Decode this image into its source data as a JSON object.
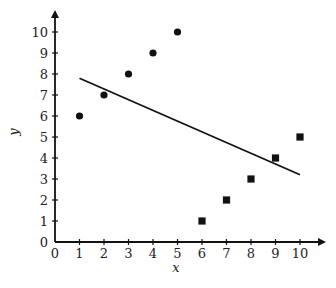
{
  "chart_data": {
    "type": "scatter",
    "title": "",
    "xlabel": "x",
    "ylabel": "y",
    "xlim": [
      0,
      10
    ],
    "ylim": [
      0,
      10
    ],
    "x_ticks": [
      "0",
      "1",
      "2",
      "3",
      "4",
      "5",
      "6",
      "7",
      "8",
      "9",
      "10"
    ],
    "y_ticks": [
      "0",
      "1",
      "2",
      "3",
      "4",
      "5",
      "6",
      "7",
      "8",
      "9",
      "10"
    ],
    "grid": false,
    "legend": null,
    "series": [
      {
        "name": "circles",
        "marker": "circle",
        "color": "#111111",
        "points": [
          [
            1,
            6
          ],
          [
            2,
            7
          ],
          [
            3,
            8
          ],
          [
            4,
            9
          ],
          [
            5,
            10
          ]
        ]
      },
      {
        "name": "squares",
        "marker": "square",
        "color": "#111111",
        "points": [
          [
            6,
            1
          ],
          [
            7,
            2
          ],
          [
            8,
            3
          ],
          [
            9,
            4
          ],
          [
            10,
            5
          ]
        ]
      }
    ],
    "regression_line": {
      "from": [
        1,
        7.8
      ],
      "to": [
        10,
        3.2
      ],
      "color": "#111111"
    }
  }
}
